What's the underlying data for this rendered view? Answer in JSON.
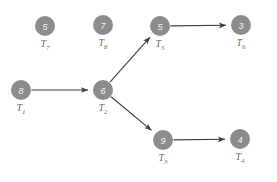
{
  "diagram": {
    "background_color": "#ffffff",
    "node_color": "#8c8c8c",
    "node_text_color": "#f2f2f2",
    "label_color": "#6e6e6e",
    "edge_color": "#3f3f3f",
    "node_radius": 10,
    "nodes": [
      {
        "id": "T7",
        "value": "5",
        "label_base": "T",
        "label_sub": "7",
        "cx": 45,
        "cy": 26
      },
      {
        "id": "T8",
        "value": "7",
        "label_base": "T",
        "label_sub": "8",
        "cx": 103,
        "cy": 25
      },
      {
        "id": "T5",
        "value": "5",
        "label_base": "T",
        "label_sub": "5",
        "cx": 160,
        "cy": 26
      },
      {
        "id": "T6",
        "value": "3",
        "label_base": "T",
        "label_sub": "6",
        "cx": 241,
        "cy": 25
      },
      {
        "id": "T1",
        "value": "8",
        "label_base": "T",
        "label_sub": "1",
        "cx": 21,
        "cy": 90
      },
      {
        "id": "T2",
        "value": "6",
        "label_base": "T",
        "label_sub": "2",
        "cx": 103,
        "cy": 90
      },
      {
        "id": "T3",
        "value": "9",
        "label_base": "T",
        "label_sub": "3",
        "cx": 163,
        "cy": 140
      },
      {
        "id": "T4",
        "value": "4",
        "label_base": "T",
        "label_sub": "4",
        "cx": 240,
        "cy": 139
      }
    ],
    "edges": [
      {
        "id": "edge-T1-T2",
        "from": "T1",
        "to": "T2"
      },
      {
        "id": "edge-T2-T5",
        "from": "T2",
        "to": "T5"
      },
      {
        "id": "edge-T2-T3",
        "from": "T2",
        "to": "T3"
      },
      {
        "id": "edge-T5-T6",
        "from": "T5",
        "to": "T6"
      },
      {
        "id": "edge-T3-T4",
        "from": "T3",
        "to": "T4"
      }
    ],
    "isolated_nodes": [
      "T7",
      "T8"
    ]
  }
}
